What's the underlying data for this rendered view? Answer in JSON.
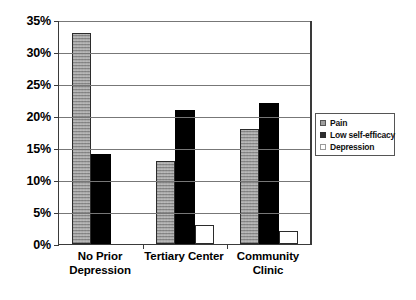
{
  "chart_data": {
    "type": "bar",
    "title": "",
    "subtitle": "",
    "xlabel": "",
    "ylabel": "",
    "categories": [
      "No Prior Depression",
      "Tertiary Center",
      "Community Clinic"
    ],
    "series": [
      {
        "name": "Pain",
        "values": [
          33,
          13,
          18
        ]
      },
      {
        "name": "Low self-efficacy",
        "values": [
          14,
          21,
          22
        ]
      },
      {
        "name": "Depression",
        "values": [
          0,
          3,
          2
        ]
      }
    ],
    "ylim": [
      0,
      35
    ],
    "ytick_step": 5,
    "ytick_labels": [
      "0%",
      "5%",
      "10%",
      "15%",
      "20%",
      "25%",
      "30%",
      "35%"
    ],
    "ytick_values": [
      0,
      5,
      10,
      15,
      20,
      25,
      30,
      35
    ],
    "grid": true,
    "legend_position": "right",
    "value_format": "percent"
  },
  "legend": {
    "items": [
      {
        "label": "Pain",
        "swatch": "pain-swatch"
      },
      {
        "label": "Low self-efficacy",
        "swatch": "low-self-efficacy-swatch"
      },
      {
        "label": "Depression",
        "swatch": "depression-swatch"
      }
    ]
  },
  "colors": {
    "pain": "#a8a8a8",
    "low_self_efficacy": "#000000",
    "depression": "#ffffff",
    "axis": "#3a3a3a",
    "gridline": "#777777",
    "background": "#ffffff"
  }
}
